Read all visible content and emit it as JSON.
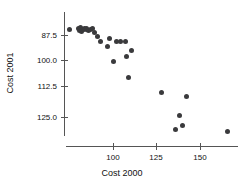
{
  "chart_data": {
    "type": "scatter",
    "title": "",
    "xlabel": "Cost 2000",
    "ylabel": "Cost 2001",
    "xticks": [
      "100",
      "125",
      "150"
    ],
    "xtick_values": [
      100,
      125,
      150
    ],
    "yticks": [
      "87.5",
      "100.0",
      "112.5",
      "125.0"
    ],
    "ytick_values": [
      87.5,
      100.0,
      112.5,
      125.0
    ],
    "xlim": [
      72,
      171
    ],
    "ylim": [
      83,
      132
    ],
    "grid": false,
    "legend": null,
    "marker": "filled-circle",
    "marker_color": "#3a3a3c",
    "points": [
      {
        "x": 75.0,
        "y": 85.0
      },
      {
        "x": 80.0,
        "y": 84.5
      },
      {
        "x": 81.0,
        "y": 85.5
      },
      {
        "x": 81.5,
        "y": 84.2
      },
      {
        "x": 82.0,
        "y": 85.8
      },
      {
        "x": 82.5,
        "y": 84.8
      },
      {
        "x": 83.0,
        "y": 85.2
      },
      {
        "x": 83.5,
        "y": 84.4
      },
      {
        "x": 84.5,
        "y": 85.0
      },
      {
        "x": 85.0,
        "y": 84.6
      },
      {
        "x": 86.0,
        "y": 85.3
      },
      {
        "x": 87.0,
        "y": 84.8
      },
      {
        "x": 88.0,
        "y": 84.3
      },
      {
        "x": 89.5,
        "y": 86.3
      },
      {
        "x": 91.0,
        "y": 88.4
      },
      {
        "x": 93.0,
        "y": 90.4
      },
      {
        "x": 97.0,
        "y": 92.8
      },
      {
        "x": 98.0,
        "y": 89.0
      },
      {
        "x": 100.0,
        "y": 99.8
      },
      {
        "x": 102.0,
        "y": 90.5
      },
      {
        "x": 104.5,
        "y": 90.6
      },
      {
        "x": 107.0,
        "y": 90.4
      },
      {
        "x": 107.5,
        "y": 97.3
      },
      {
        "x": 109.0,
        "y": 106.8
      },
      {
        "x": 110.5,
        "y": 94.8
      },
      {
        "x": 128.0,
        "y": 113.8
      },
      {
        "x": 136.0,
        "y": 130.8
      },
      {
        "x": 138.5,
        "y": 124.5
      },
      {
        "x": 140.0,
        "y": 128.8
      },
      {
        "x": 142.5,
        "y": 115.5
      },
      {
        "x": 166.0,
        "y": 131.5
      }
    ]
  },
  "axes": {
    "y_tick_positions_px": [
      35,
      60,
      86,
      117
    ],
    "x_tick_positions_px": [
      113,
      156,
      200
    ]
  }
}
